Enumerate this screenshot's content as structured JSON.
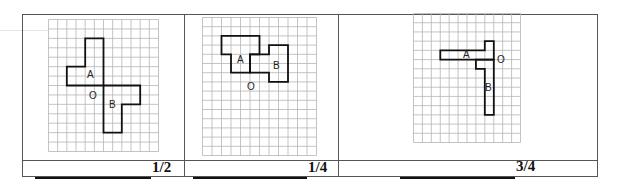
{
  "figures": [
    {
      "id": "fig1",
      "grid": {
        "cols": 12,
        "rows": 14
      },
      "shape_a": [
        [
          4,
          2
        ],
        [
          6,
          2
        ],
        [
          6,
          7
        ],
        [
          2,
          7
        ],
        [
          2,
          5
        ],
        [
          4,
          5
        ]
      ],
      "shape_b": [
        [
          6,
          7
        ],
        [
          10,
          7
        ],
        [
          10,
          9
        ],
        [
          8,
          9
        ],
        [
          8,
          12
        ],
        [
          6,
          12
        ]
      ],
      "labels": {
        "a": "A",
        "b": "B",
        "o": "O"
      },
      "answer": "1/2"
    },
    {
      "id": "fig2",
      "grid": {
        "cols": 12,
        "rows": 15
      },
      "shape_a": [
        [
          2,
          2
        ],
        [
          6,
          2
        ],
        [
          6,
          4
        ],
        [
          5,
          4
        ],
        [
          5,
          6
        ],
        [
          3,
          6
        ],
        [
          3,
          4
        ],
        [
          2,
          4
        ]
      ],
      "shape_b": [
        [
          5,
          4
        ],
        [
          7,
          4
        ],
        [
          7,
          3
        ],
        [
          9,
          3
        ],
        [
          9,
          7
        ],
        [
          7,
          7
        ],
        [
          7,
          6
        ],
        [
          5,
          6
        ]
      ],
      "labels": {
        "a": "A",
        "b": "B",
        "o": "O"
      },
      "answer": "1/4"
    },
    {
      "id": "fig3",
      "grid": {
        "cols": 12,
        "rows": 14
      },
      "shape_a": [
        [
          3,
          4
        ],
        [
          8,
          4
        ],
        [
          8,
          3
        ],
        [
          9,
          3
        ],
        [
          9,
          5
        ],
        [
          3,
          5
        ]
      ],
      "shape_b": [
        [
          7,
          5
        ],
        [
          9,
          5
        ],
        [
          9,
          11
        ],
        [
          8,
          11
        ],
        [
          8,
          6
        ],
        [
          7,
          6
        ]
      ],
      "labels": {
        "a": "A",
        "b": "B",
        "o": "O"
      },
      "answer": "3/4"
    }
  ],
  "colors": {
    "grid": "#b5b5b5",
    "outline": "#111111",
    "border": "#555555"
  }
}
